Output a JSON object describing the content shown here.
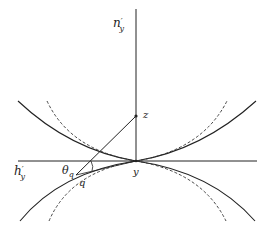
{
  "diagram": {
    "labels": {
      "vertical_axis": "n",
      "vertical_axis_sup": "′",
      "vertical_axis_sub": "y",
      "horizontal_axis": "h",
      "horizontal_axis_sup": "′",
      "horizontal_axis_sub": "y",
      "point_z": "z",
      "point_y": "y",
      "point_q": "q",
      "angle": "θ",
      "angle_sub": "q"
    },
    "colors": {
      "stroke": "#222222",
      "background": "#ffffff"
    }
  }
}
